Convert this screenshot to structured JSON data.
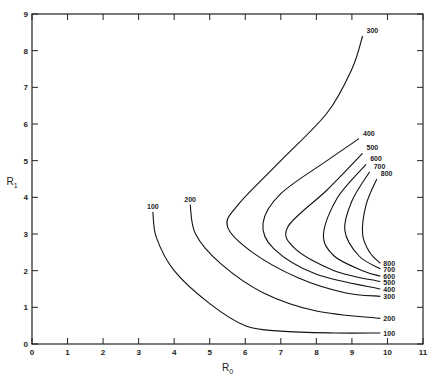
{
  "chart_data": {
    "type": "line",
    "title": "",
    "xlabel": "R0",
    "ylabel": "R1",
    "xlim": [
      0,
      11
    ],
    "ylim": [
      0,
      9
    ],
    "x_ticks": [
      "0",
      "1",
      "2",
      "3",
      "4",
      "5",
      "6",
      "7",
      "8",
      "9",
      "10",
      "11"
    ],
    "y_ticks": [
      "0",
      "1",
      "2",
      "3",
      "4",
      "5",
      "6",
      "7",
      "8",
      "9"
    ],
    "grid": false,
    "series": [
      {
        "name": "100",
        "points": [
          [
            3.4,
            3.6
          ],
          [
            3.5,
            2.9
          ],
          [
            4.0,
            2.0
          ],
          [
            5.0,
            1.1
          ],
          [
            6.0,
            0.5
          ],
          [
            7.0,
            0.35
          ],
          [
            8.5,
            0.3
          ],
          [
            9.8,
            0.3
          ]
        ]
      },
      {
        "name": "200",
        "points": [
          [
            4.45,
            3.8
          ],
          [
            4.6,
            3.0
          ],
          [
            5.3,
            2.2
          ],
          [
            6.5,
            1.4
          ],
          [
            8.0,
            0.9
          ],
          [
            9.8,
            0.7
          ]
        ]
      },
      {
        "name": "300",
        "points": [
          [
            9.3,
            8.4
          ],
          [
            9.0,
            7.5
          ],
          [
            8.3,
            6.3
          ],
          [
            7.0,
            5.0
          ],
          [
            5.8,
            3.8
          ],
          [
            5.5,
            3.2
          ],
          [
            6.2,
            2.5
          ],
          [
            7.5,
            1.8
          ],
          [
            8.8,
            1.4
          ],
          [
            9.8,
            1.3
          ]
        ]
      },
      {
        "name": "400",
        "points": [
          [
            9.2,
            5.6
          ],
          [
            8.3,
            5.0
          ],
          [
            7.0,
            4.1
          ],
          [
            6.5,
            3.3
          ],
          [
            6.8,
            2.6
          ],
          [
            8.0,
            1.9
          ],
          [
            9.8,
            1.5
          ]
        ]
      },
      {
        "name": "500",
        "points": [
          [
            9.3,
            5.2
          ],
          [
            8.3,
            4.2
          ],
          [
            7.2,
            3.2
          ],
          [
            7.4,
            2.6
          ],
          [
            8.5,
            2.0
          ],
          [
            9.8,
            1.7
          ]
        ]
      },
      {
        "name": "600",
        "points": [
          [
            9.4,
            4.9
          ],
          [
            8.6,
            4.0
          ],
          [
            8.2,
            3.0
          ],
          [
            8.5,
            2.4
          ],
          [
            9.3,
            2.0
          ],
          [
            9.8,
            1.85
          ]
        ]
      },
      {
        "name": "700",
        "points": [
          [
            9.5,
            4.7
          ],
          [
            9.0,
            3.9
          ],
          [
            8.8,
            3.1
          ],
          [
            9.2,
            2.4
          ],
          [
            9.8,
            2.05
          ]
        ]
      },
      {
        "name": "800",
        "points": [
          [
            9.7,
            4.5
          ],
          [
            9.4,
            3.8
          ],
          [
            9.3,
            3.0
          ],
          [
            9.5,
            2.5
          ],
          [
            9.8,
            2.2
          ]
        ]
      }
    ]
  },
  "labels": {
    "x_axis": "R",
    "x_sub": "0",
    "y_axis": "R",
    "y_sub": "1"
  }
}
